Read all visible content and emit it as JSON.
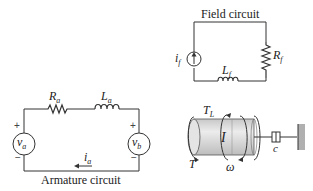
{
  "field_circuit": {
    "caption": "Field circuit",
    "source_label": "i",
    "source_sub": "f",
    "resistor_label": "R",
    "resistor_sub": "f",
    "inductor_label": "L",
    "inductor_sub": "f"
  },
  "armature_circuit": {
    "caption": "Armature circuit",
    "resistor_label": "R",
    "resistor_sub": "a",
    "inductor_label": "L",
    "inductor_sub": "a",
    "source_left_label": "v",
    "source_left_sub": "a",
    "source_right_label": "v",
    "source_right_sub": "b",
    "current_label": "i",
    "current_sub": "a",
    "plus": "+",
    "minus": "−"
  },
  "mechanical": {
    "inertia_label": "I",
    "load_torque_label": "T",
    "load_torque_sub": "L",
    "torque_label": "T",
    "speed_label": "ω",
    "damper_label": "c"
  },
  "colors": {
    "line": "#333333",
    "cylinder_body": "#d6d6d6",
    "cylinder_end": "#e6e6e6",
    "wall": "#b0b0b0"
  }
}
